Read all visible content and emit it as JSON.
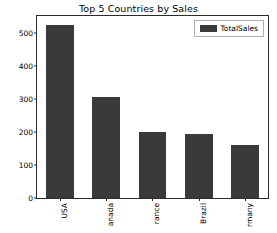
{
  "chart_data": {
    "type": "bar",
    "title": "Top 5 Countries by Sales",
    "xlabel": "",
    "ylabel": "Total Sales",
    "categories": [
      "USA",
      "anada",
      "rance",
      "Brazil",
      "rmany"
    ],
    "values": [
      523,
      305,
      198,
      194,
      159
    ],
    "series": [
      {
        "name": "TotalSales",
        "values": [
          523,
          305,
          198,
          194,
          159
        ]
      }
    ],
    "ylim": [
      0,
      550
    ],
    "yticks": [
      0,
      100,
      200,
      300,
      400,
      500
    ],
    "ytick_labels": [
      "0",
      "100",
      "200",
      "300",
      "400",
      "500"
    ],
    "grid": false,
    "legend": {
      "position": "upper-right",
      "entries": [
        "TotalSales"
      ]
    },
    "xtick_rotation": 90,
    "bar_color": "#3a3a3a",
    "axes_color": "#2b2b2b",
    "background_color": "#ffffff"
  },
  "legend": {
    "label": "TotalSales"
  }
}
